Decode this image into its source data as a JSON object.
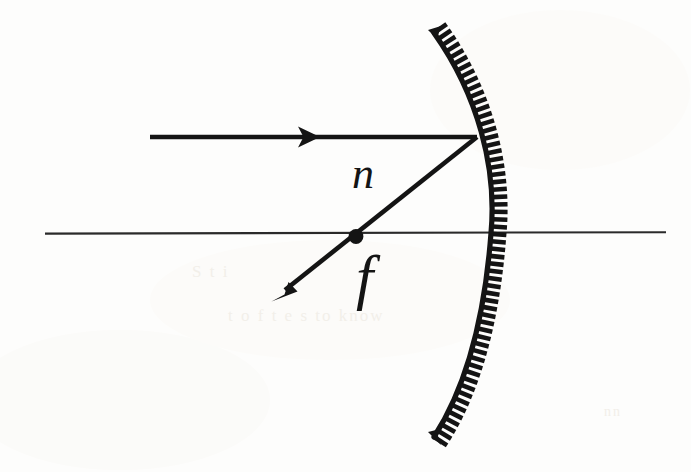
{
  "figure": {
    "background_color": "#fdfdfc",
    "ink_color": "#141414",
    "width": 691,
    "height": 472,
    "labels": {
      "normal_ray": "n",
      "focal_point": "f"
    },
    "ghost_show_through": {
      "line_1": "S      t            i",
      "line_2": "t  o f t e s    to  know",
      "line_3": "nn"
    },
    "elements": {
      "optical_axis_name": "optical-axis",
      "mirror_name": "concave-mirror",
      "incident_ray_name": "incident-ray",
      "reflected_ray_name": "reflected-ray",
      "focal_point_name": "focal-point-dot"
    },
    "geometry": {
      "optical_axis": {
        "x1": 45,
        "y1": 233,
        "x2": 666,
        "y2": 232
      },
      "incident_ray": {
        "x1": 150,
        "y1": 137,
        "x2": 477,
        "y2": 137
      },
      "incident_arrowhead": {
        "x": 318,
        "y": 137
      },
      "reflected_ray": {
        "x1": 477,
        "y1": 137,
        "x2": 273,
        "y2": 300
      },
      "focal_point": {
        "cx": 356,
        "cy": 236,
        "r": 7
      },
      "mirror_arc": {
        "top": {
          "x": 434,
          "y": 33
        },
        "vertex": {
          "x": 491,
          "y": 233
        },
        "bottom": {
          "x": 434,
          "y": 437
        },
        "hatch_count": 58
      }
    }
  }
}
